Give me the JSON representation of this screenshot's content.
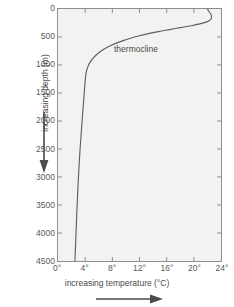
{
  "chart_data": {
    "type": "line",
    "title": "",
    "xlabel": "increasing temperature (°C)",
    "ylabel": "increasing depth (m)",
    "xlim": [
      0,
      24
    ],
    "ylim": [
      0,
      4500
    ],
    "y_inverted": true,
    "grid": false,
    "legend": "none",
    "xticks": [
      0,
      4,
      8,
      12,
      16,
      20,
      24
    ],
    "xtick_labels": [
      "0°",
      "4°",
      "8°",
      "12°",
      "16°",
      "20°",
      "24°"
    ],
    "yticks": [
      0,
      500,
      1000,
      1500,
      2000,
      2500,
      3000,
      3500,
      4000,
      4500
    ],
    "ytick_labels": [
      "0",
      "500",
      "1000",
      "1500",
      "2000",
      "2500",
      "3000",
      "3500",
      "4000",
      "4500"
    ],
    "series": [
      {
        "name": "ocean temperature profile",
        "x": [
          22.0,
          22.2,
          22.5,
          22.6,
          22.5,
          22.0,
          21.0,
          19.6,
          18.0,
          16.4,
          14.8,
          13.3,
          12.0,
          10.8,
          9.7,
          8.7,
          7.8,
          7.0,
          6.3,
          5.7,
          5.2,
          4.8,
          4.5,
          4.3,
          4.15,
          4.05,
          3.95,
          3.85,
          3.7,
          3.55,
          3.4,
          3.25,
          3.1,
          2.95,
          2.8,
          2.65,
          2.5
        ],
        "y": [
          0,
          40,
          90,
          140,
          185,
          225,
          262,
          298,
          333,
          368,
          403,
          440,
          478,
          518,
          560,
          605,
          652,
          702,
          755,
          812,
          872,
          935,
          1000,
          1065,
          1130,
          1220,
          1350,
          1520,
          1750,
          2000,
          2250,
          2500,
          2800,
          3150,
          3550,
          4000,
          4500
        ]
      }
    ],
    "annotations": [
      {
        "text": "thermocline",
        "x": 8.5,
        "y": 790
      }
    ],
    "axis_arrows": [
      {
        "name": "y-axis-direction-arrow",
        "direction": "down"
      },
      {
        "name": "x-axis-direction-arrow",
        "direction": "right"
      }
    ],
    "colors": {
      "plot_background": "#f2f2f0",
      "curve": "#5f5f5f",
      "axis": "#8d8d8d",
      "text": "#4a4a4a",
      "tick_text": "#5a5a5a",
      "page_background": "#ffffff"
    }
  }
}
